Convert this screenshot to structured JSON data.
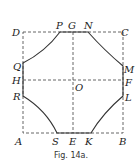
{
  "caption": "Fig. 14a.",
  "labels": {
    "D": "D",
    "P": "P",
    "G": "G",
    "N": "N",
    "C": "C",
    "Q": "Q",
    "H": "H",
    "R": "R",
    "O": "O",
    "M": "M",
    "F": "F",
    "L": "L",
    "A": "A",
    "S": "S",
    "E": "E",
    "K": "K",
    "B": "B"
  },
  "colors": {
    "line": "#333333",
    "dash": "#555555"
  }
}
